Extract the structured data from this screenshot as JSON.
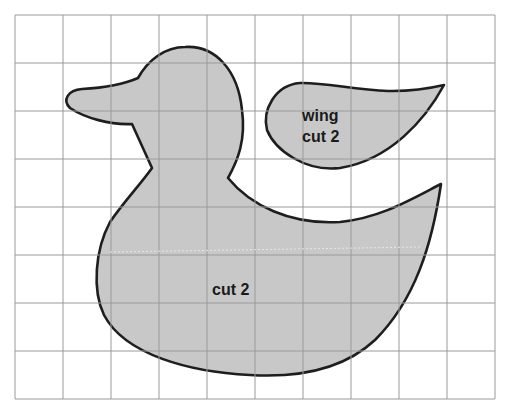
{
  "pattern": {
    "title": "",
    "grid": {
      "columns": 10,
      "rows": 8,
      "left": 15,
      "top": 15,
      "cell": 48,
      "line_color": "#9a9a9a"
    },
    "colors": {
      "fill": "#c8c8c8",
      "outline": "#1e1e1e",
      "background": "#ffffff"
    },
    "pieces": [
      {
        "name": "body",
        "label": "cut 2"
      },
      {
        "name": "wing",
        "label_line1": "wing",
        "label_line2": "cut 2"
      }
    ]
  }
}
